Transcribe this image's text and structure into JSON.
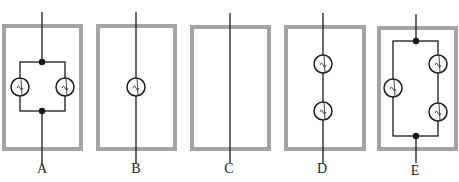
{
  "figure": {
    "colors": {
      "box_border": "#a4a4a4",
      "wire": "#1a1a1a",
      "background": "#ffffff"
    },
    "panels": [
      {
        "label": "A",
        "arrangement": "two bulbs in parallel",
        "bulbs": 2
      },
      {
        "label": "B",
        "arrangement": "single bulb in series",
        "bulbs": 1
      },
      {
        "label": "C",
        "arrangement": "straight wire, no bulb",
        "bulbs": 0
      },
      {
        "label": "D",
        "arrangement": "two bulbs in series",
        "bulbs": 2
      },
      {
        "label": "E",
        "arrangement": "one bulb in parallel with two series bulbs",
        "bulbs": 3
      }
    ]
  }
}
